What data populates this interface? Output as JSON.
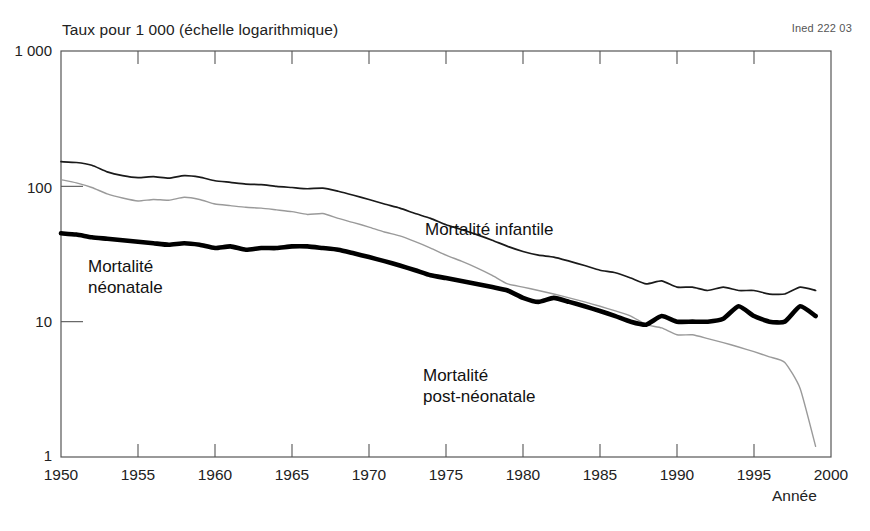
{
  "chart_data": {
    "type": "line",
    "title": "Taux pour 1 000 (échelle logarithmique)",
    "subtitle": "",
    "xlabel": "Année",
    "ylabel": "Taux pour 1 000 (échelle logarithmique)",
    "scale": "log",
    "grid": false,
    "legend_position": "inline-annotations",
    "xlim": [
      1950,
      2000
    ],
    "ylim": [
      1,
      1000
    ],
    "xticks": [
      1950,
      1955,
      1960,
      1965,
      1970,
      1975,
      1980,
      1985,
      1990,
      1995,
      2000
    ],
    "xtick_labels": [
      "1950",
      "1955",
      "1960",
      "1965",
      "1970",
      "1975",
      "1980",
      "1985",
      "1990",
      "1995",
      "2000"
    ],
    "yticks": [
      1,
      10,
      100,
      1000
    ],
    "ytick_labels": [
      "1",
      "10",
      "100",
      "1 000"
    ],
    "source_note": "Ined 222 03",
    "x": [
      1950,
      1951,
      1952,
      1953,
      1954,
      1955,
      1956,
      1957,
      1958,
      1959,
      1960,
      1961,
      1962,
      1963,
      1964,
      1965,
      1966,
      1967,
      1968,
      1969,
      1970,
      1971,
      1972,
      1973,
      1974,
      1975,
      1976,
      1977,
      1978,
      1979,
      1980,
      1981,
      1982,
      1983,
      1984,
      1985,
      1986,
      1987,
      1988,
      1989,
      1990,
      1991,
      1992,
      1993,
      1994,
      1995,
      1996,
      1997,
      1998,
      1999
    ],
    "series": [
      {
        "name": "Mortalité infantile",
        "style": "thin-dark",
        "color": "#1a1a1a",
        "values": [
          152,
          150,
          143,
          128,
          120,
          116,
          118,
          115,
          120,
          117,
          110,
          107,
          104,
          103,
          100,
          98,
          96,
          97,
          92,
          86,
          80,
          74,
          69,
          63,
          58,
          52,
          48,
          44,
          40,
          36,
          33,
          31,
          30,
          28,
          26,
          24,
          23,
          21,
          19,
          20,
          18,
          18,
          17,
          18,
          17,
          17,
          16,
          16,
          18,
          17
        ]
      },
      {
        "name": "Mortalité néonatale",
        "style": "thick-dark",
        "color": "#000000",
        "values": [
          45,
          44,
          42,
          41,
          40,
          39,
          38,
          37,
          38,
          37,
          35,
          36,
          34,
          35,
          35,
          36,
          36,
          35,
          34,
          32,
          30,
          28,
          26,
          24,
          22,
          21,
          20,
          19,
          18,
          17,
          15,
          14,
          15,
          14,
          13,
          12,
          11,
          10,
          9.5,
          11,
          10,
          10,
          10,
          10.5,
          13,
          11,
          10,
          10,
          13,
          11
        ]
      },
      {
        "name": "Mortalité post-néonatale",
        "style": "thin-grey",
        "color": "#9a9a9a",
        "values": [
          112,
          106,
          98,
          88,
          82,
          78,
          80,
          79,
          83,
          80,
          74,
          72,
          70,
          69,
          67,
          65,
          62,
          63,
          58,
          54,
          50,
          46,
          43,
          39,
          35,
          31,
          28,
          25,
          22,
          19,
          18,
          17,
          16,
          15,
          14,
          13,
          12,
          11,
          9.5,
          9,
          8,
          8,
          7.5,
          7,
          6.5,
          6,
          5.5,
          5,
          3.2,
          1.2
        ]
      }
    ],
    "annotations": [
      {
        "name": "Mortalité infantile",
        "text": "Mortalité infantile",
        "x": 1977,
        "y": 35
      },
      {
        "name": "Mortalité néonatale",
        "text": "Mortalité néonatale",
        "x": 1952,
        "y": 25
      },
      {
        "name": "Mortalité post-néonatale",
        "text": "Mortalité post-néonatale",
        "x": 1977,
        "y": 4.5
      }
    ]
  },
  "labels": {
    "y_axis_title": "Taux pour 1 000 (échelle logarithmique)",
    "x_axis_title": "Année",
    "source_note": "Ined 222 03",
    "y_1000": "1 000",
    "y_100": "100",
    "y_10": "10",
    "y_1": "1",
    "x_1950": "1950",
    "x_1955": "1955",
    "x_1960": "1960",
    "x_1965": "1965",
    "x_1970": "1970",
    "x_1975": "1975",
    "x_1980": "1980",
    "x_1985": "1985",
    "x_1990": "1990",
    "x_1995": "1995",
    "x_2000": "2000",
    "series_infantile_line1": "Mortalité infantile",
    "series_neonatale_line1": "Mortalité",
    "series_neonatale_line2": "néonatale",
    "series_postneonatale_line1": "Mortalité",
    "series_postneonatale_line2": "post-néonatale"
  },
  "colors": {
    "axis": "#555555",
    "infantile": "#1a1a1a",
    "neonatale": "#000000",
    "postneonatale": "#9a9a9a",
    "background": "#ffffff"
  }
}
